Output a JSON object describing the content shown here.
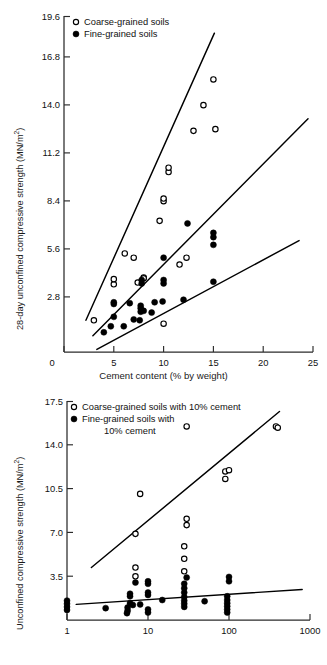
{
  "figure": {
    "title": "",
    "panels": [
      "top",
      "bottom"
    ]
  },
  "top": {
    "ylabel_main": "28-day unconfined compressive strength (MN/m",
    "ylabel_sup": "2",
    "ylabel_tail": ")",
    "ylabel_full": "28-day unconfined compressive strength (MN/m2)",
    "xlabel": "Cement content (% by weight)",
    "legend": [
      {
        "marker": "open-circle",
        "label": "Coarse-grained soils"
      },
      {
        "marker": "filled-circle",
        "label": "Fine-grained soils"
      }
    ],
    "yticks": [
      "2.8",
      "5.6",
      "8.4",
      "11.2",
      "14.0",
      "16.8",
      "19.6"
    ],
    "xticks": [
      "0",
      "5",
      "10",
      "15",
      "20",
      "25"
    ]
  },
  "bottom": {
    "ylabel_main": "Unconfined compressive strength (MN/m",
    "ylabel_sup": "2",
    "ylabel_tail": ")",
    "ylabel_full": "Unconfined compressive strength (MN/m2)",
    "xlabel": "Curling time (days)",
    "legend": [
      {
        "marker": "open-circle",
        "label": "Coarse-grained soils with 10% cement"
      },
      {
        "marker": "filled-circle",
        "label": "Fine-grained soils with"
      },
      {
        "marker": "none",
        "label": "10% cement"
      }
    ],
    "yticks": [
      "3.5",
      "7.0",
      "10.5",
      "14.0",
      "17.5"
    ],
    "xticks": [
      "1",
      "10",
      "100",
      "1000"
    ]
  },
  "chart_data": [
    {
      "type": "scatter",
      "id": "top-panel",
      "title": "",
      "xlabel": "Cement content (% by weight)",
      "ylabel": "28-day unconfined compressive strength (MN/m2)",
      "xlim": [
        0,
        25
      ],
      "ylim": [
        0,
        19.6
      ],
      "xticks": [
        0,
        5,
        10,
        15,
        20,
        25
      ],
      "yticks": [
        2.8,
        5.6,
        8.4,
        11.2,
        14.0,
        16.8,
        19.6
      ],
      "xscale": "linear",
      "yscale": "linear",
      "grid": false,
      "legend_position": "top-left",
      "series": [
        {
          "name": "Coarse-grained soils",
          "marker": "open-circle",
          "points": [
            [
              3.0,
              1.85
            ],
            [
              5.0,
              3.95
            ],
            [
              5.0,
              4.25
            ],
            [
              6.1,
              5.75
            ],
            [
              7.0,
              5.5
            ],
            [
              7.4,
              4.05
            ],
            [
              8.0,
              4.35
            ],
            [
              8.0,
              4.3
            ],
            [
              9.6,
              7.65
            ],
            [
              10.0,
              1.65
            ],
            [
              10.0,
              8.8
            ],
            [
              10.0,
              8.95
            ],
            [
              10.5,
              10.5
            ],
            [
              10.5,
              10.75
            ],
            [
              11.6,
              5.1
            ],
            [
              12.3,
              5.5
            ],
            [
              13.0,
              12.9
            ],
            [
              14.0,
              14.4
            ],
            [
              15.0,
              15.9
            ],
            [
              15.2,
              13.0
            ]
          ]
        },
        {
          "name": "Fine-grained soils",
          "marker": "filled-circle",
          "points": [
            [
              4.0,
              1.15
            ],
            [
              4.7,
              1.5
            ],
            [
              5.0,
              2.05
            ],
            [
              5.0,
              2.8
            ],
            [
              5.0,
              2.9
            ],
            [
              6.0,
              1.5
            ],
            [
              6.6,
              2.85
            ],
            [
              7.0,
              1.9
            ],
            [
              7.6,
              1.85
            ],
            [
              7.7,
              2.35
            ],
            [
              7.7,
              2.55
            ],
            [
              7.7,
              2.7
            ],
            [
              7.8,
              4.0
            ],
            [
              7.8,
              4.2
            ],
            [
              8.0,
              2.4
            ],
            [
              8.8,
              2.3
            ],
            [
              9.1,
              2.9
            ],
            [
              9.9,
              2.95
            ],
            [
              10.0,
              4.0
            ],
            [
              10.0,
              4.2
            ],
            [
              10.0,
              5.5
            ],
            [
              12.0,
              3.05
            ],
            [
              12.4,
              7.5
            ],
            [
              15.0,
              4.1
            ],
            [
              15.0,
              6.7
            ],
            [
              15.0,
              6.95
            ],
            [
              15.0,
              6.25
            ]
          ]
        }
      ],
      "trend_lines": [
        {
          "name": "upper-envelope",
          "x": [
            2.2,
            15.1
          ],
          "y": [
            1.85,
            18.6
          ]
        },
        {
          "name": "middle-envelope",
          "x": [
            2.9,
            24.5
          ],
          "y": [
            0.95,
            13.6
          ]
        },
        {
          "name": "lower-envelope",
          "x": [
            3.3,
            23.6
          ],
          "y": [
            0.15,
            6.5
          ]
        }
      ]
    },
    {
      "type": "scatter",
      "id": "bottom-panel",
      "title": "",
      "xlabel": "Curling time (days)",
      "ylabel": "Unconfined compressive strength (MN/m2)",
      "xlim": [
        1,
        1000
      ],
      "ylim": [
        0,
        17.5
      ],
      "xticks": [
        1,
        10,
        100,
        1000
      ],
      "yticks": [
        3.5,
        7.0,
        10.5,
        14.0,
        17.5
      ],
      "xscale": "log",
      "yscale": "linear",
      "grid": false,
      "legend_position": "top-left",
      "series": [
        {
          "name": "Coarse-grained soils with 10% cement",
          "marker": "open-circle",
          "points": [
            [
              7.0,
              3.5
            ],
            [
              7.0,
              4.2
            ],
            [
              7.0,
              6.9
            ],
            [
              8.0,
              10.1
            ],
            [
              28.0,
              3.9
            ],
            [
              28.0,
              4.9
            ],
            [
              28.0,
              5.9
            ],
            [
              30.0,
              7.6
            ],
            [
              30.0,
              8.1
            ],
            [
              30.0,
              15.5
            ],
            [
              90.0,
              11.3
            ],
            [
              90.0,
              11.9
            ],
            [
              100.0,
              12.0
            ],
            [
              380.0,
              15.5
            ],
            [
              400.0,
              15.4
            ]
          ]
        },
        {
          "name": "Fine-grained soils with 10% cement",
          "marker": "filled-circle",
          "points": [
            [
              1.0,
              0.8
            ],
            [
              1.0,
              1.05
            ],
            [
              1.0,
              1.3
            ],
            [
              1.0,
              1.55
            ],
            [
              3.0,
              0.95
            ],
            [
              5.5,
              0.55
            ],
            [
              5.6,
              0.75
            ],
            [
              5.6,
              1.0
            ],
            [
              6.0,
              1.35
            ],
            [
              6.0,
              1.9
            ],
            [
              6.0,
              2.1
            ],
            [
              6.5,
              1.2
            ],
            [
              7.0,
              3.0
            ],
            [
              8.0,
              1.25
            ],
            [
              10.0,
              0.6
            ],
            [
              10.0,
              0.85
            ],
            [
              10.0,
              2.0
            ],
            [
              10.0,
              2.2
            ],
            [
              10.0,
              2.9
            ],
            [
              10.0,
              3.1
            ],
            [
              15.0,
              1.6
            ],
            [
              28.0,
              1.05
            ],
            [
              28.0,
              1.3
            ],
            [
              28.0,
              1.55
            ],
            [
              28.0,
              1.85
            ],
            [
              28.0,
              2.2
            ],
            [
              28.0,
              2.55
            ],
            [
              28.0,
              2.9
            ],
            [
              30.0,
              3.4
            ],
            [
              50.0,
              1.5
            ],
            [
              95.0,
              0.6
            ],
            [
              95.0,
              0.85
            ],
            [
              95.0,
              1.1
            ],
            [
              95.0,
              1.35
            ],
            [
              95.0,
              1.6
            ],
            [
              95.0,
              1.9
            ],
            [
              100.0,
              3.1
            ],
            [
              100.0,
              3.45
            ]
          ]
        }
      ],
      "trend_lines": [
        {
          "name": "coarse-trend",
          "x": [
            2.0,
            420.0
          ],
          "y": [
            4.2,
            16.7
          ]
        },
        {
          "name": "fine-trend",
          "x": [
            1.3,
            800.0
          ],
          "y": [
            1.25,
            2.45
          ]
        }
      ]
    }
  ]
}
